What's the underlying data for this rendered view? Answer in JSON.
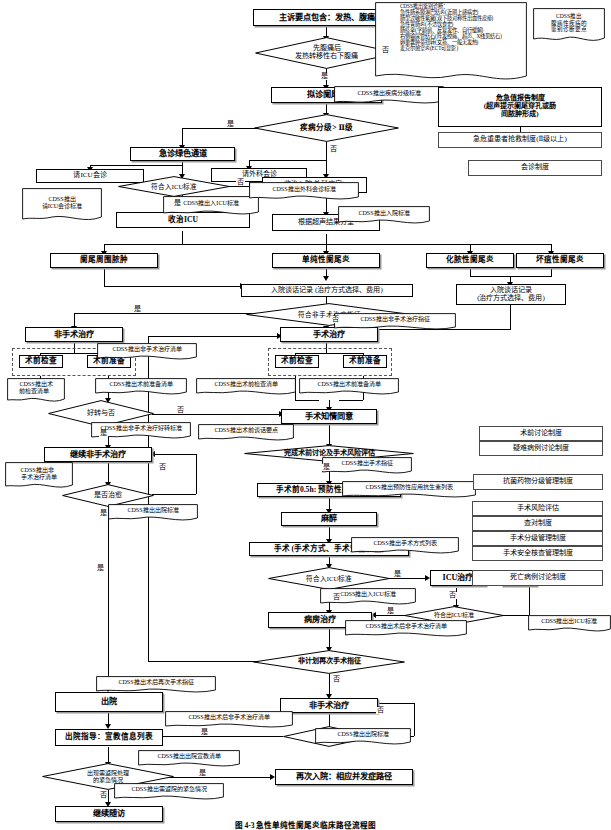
{
  "figure": {
    "caption": "图 4-3   急性单纯性阑尾炎临床路径流程图"
  },
  "flow": {
    "n_chief_complaint": "主诉要点包含：发热、腹痛",
    "d_symptom_order": "先腹痛后\n发热转移性右下腹痛",
    "n_suspect_appendicitis": "拟诊阑尾炎",
    "d_disease_grade": "疾病分级> Ⅱ级",
    "n_green_channel": "急诊绿色通道",
    "n_icu_consult": "请ICU会诊",
    "d_meet_icu": "符合入ICU标准",
    "n_admit_icu": "收治ICU",
    "n_surgery_consult": "请外科会诊",
    "n_admit_hospital": "收治入院(外科病房)",
    "n_ultrasound_type": "根据超声结果分型",
    "n_periappendiceal": "阑尾周围脓肿",
    "n_simple_appendicitis": "单纯性阑尾炎",
    "n_suppurative": "化脓性阑尾炎",
    "n_gangrenous": "坏疽性阑尾炎",
    "n_admission_talk_left": "入院谈话记录 (治疗方式选择、费用)",
    "n_admission_talk_right": "入院谈话记录\n(治疗方式选择、费用)",
    "d_nonop_indication": "符合非手术治疗指征",
    "n_nonop_treatment": "非手术治疗",
    "n_op_treatment": "手术治疗",
    "n_preop_exam_l": "术前检查",
    "n_preop_prep_l": "术前准备",
    "n_preop_exam_r": "术前检查",
    "n_preop_prep_r": "术前准备",
    "d_improved": "好转与否",
    "n_continue_nonop": "继续非手术治疗",
    "d_cured": "是否治愈",
    "n_informed_consent": "手术知情同意",
    "d_preop_discussion": "完成术前讨论及手术风险评估",
    "n_antibiotics": "手术前0.5h: 预防性应用抗生素",
    "n_anesthesia": "麻醉",
    "n_surgery": "手术 (手术方式、手术安全核查)",
    "d_meet_icu_2": "符合入ICU标准",
    "n_icu_care": "ICU治疗",
    "n_death": "死亡",
    "d_exit_icu": "符合出ICU标准",
    "n_ward_care": "病房治疗",
    "d_unplanned_reop": "非计划再次手术指征",
    "n_postop_nonop": "非手术治疗",
    "d_cured_2": "是否治愈",
    "n_discharge": "出院",
    "n_discharge_guide": "出院指导：宣教信息列表",
    "d_return_emergency": "出现需返院处理\n的紧急情况",
    "n_readmission": "再次入院：相应并发症路径",
    "n_followup": "继续随访"
  },
  "cdss": {
    "c_diff_diagnosis": "CDSS推出鉴别诊断：\n急性肠系膜淋巴结炎(近期上感病史)\n肠型过敏性紫癜(双下肢对称性出血性皮疹)\n急性胃肠炎(不洁饮食史)\n肠痉挛(学龄前、反复发作、自行缓解)\n右侧输尿管结石(阵发绞痛、超声、X线见结石)\n卵巢囊肿蒂扭转(女孩、一般无发热)\n麦克尔憩室炎(ECT可显影)",
    "c_abdominal_key": "CDSS推出\n腹痛性疾病的\n鉴别诊断要点",
    "c_grade_standard": "CDSS推出疾病分级标准",
    "c_icu_consult_standard": "CDSS推出\n请ICU会诊标准",
    "c_icu_standard": "CDSS推出入ICU标准",
    "c_surgery_consult_standard": "CDSS推出外科会诊标准",
    "c_admission_standard": "CDSS推出入院标准",
    "c_nonop_indication": "CDSS推出非手术治疗指征",
    "c_nonop_list": "CDSS推出非手术治疗清单",
    "c_preop_exam_list_l": "CDSS推出术\n前检查清单",
    "c_preop_prep_list_l": "CDSS推出术前准备清单",
    "c_preop_exam_list_r": "CDSS推出术前检查清单",
    "c_preop_prep_list_r": "CDSS推出术前准备清单",
    "c_nonop_improve_standard": "CDSS推出非手术治疗好转标准",
    "c_nonop_list2": "CDSS推出非\n手术治疗清单",
    "c_discharge_standard1": "CDSS推出出院标准",
    "c_preop_talk_key": "CDSS推出术前谈话要点",
    "c_surgery_indication": "CDSS推出手术指征",
    "c_antibiotics_list": "CDSS推出预防性应用抗生素列表",
    "c_surgery_method_list": "CDSS推出手术方式列表",
    "c_icu_standard2": "CDSS推出入ICU标准",
    "c_exit_icu_standard": "CDSS推出出ICU标准",
    "c_postop_nonop_list": "CDSS推出术后非手术治疗清单",
    "c_reop_indication": "CDSS推出术后再次手术指征",
    "c_postop_nonop_list2": "CDSS推出术后非手术治疗清单",
    "c_discharge_standard2": "CDSS推出出院标准",
    "c_discharge_edu_list": "CDSS推出出院宣教清单",
    "c_return_emergency": "CDSS推出需返院的紧急情况"
  },
  "systems": {
    "s_critical_value": "危急值报告制度\n(超声提示阑尾穿孔或肠\n间脓肿形成)",
    "s_triage": "急危重患者抢救制度(Ⅱ级以上)",
    "s_consult": "会诊制度",
    "s_preop_discussion": "术前讨论制度",
    "s_difficult_case": "疑难病例讨论制度",
    "s_antibiotic_grade": "抗菌药物分级管理制度",
    "s_surgery_risk": "手术风险评估",
    "s_checkback": "查对制度",
    "s_surgery_grade": "手术分级管理制度",
    "s_surgery_safety": "手术安全核查管理制度",
    "s_death_case": "死亡病例讨论制度"
  },
  "labels": {
    "yes": "是",
    "no": "否"
  },
  "colors": {
    "stroke": "#000000",
    "background": "#ffffff",
    "shadow": "#9a9a9a",
    "dashed": "#555555"
  }
}
